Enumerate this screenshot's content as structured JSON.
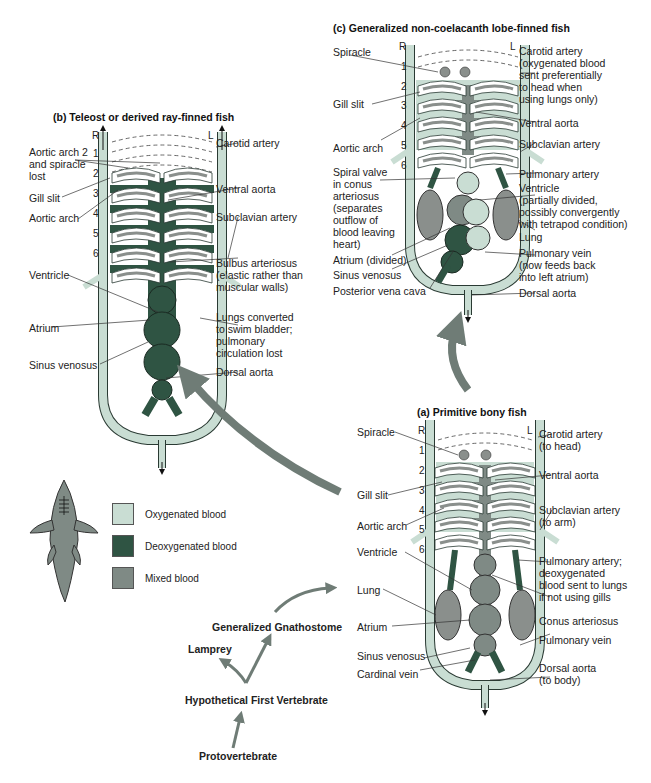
{
  "colors": {
    "oxygenated": "#c9ddd3",
    "deoxygenated": "#2f5443",
    "mixed": "#7f8a85",
    "vessel_outline": "#2a3a33",
    "gill_bar": "#8a8f8c",
    "evolution_arrow": "#6f7c76"
  },
  "legend": {
    "items": [
      {
        "label": "Oxygenated blood",
        "swatch": "oxygenated"
      },
      {
        "label": "Deoxygenated blood",
        "swatch": "deoxygenated"
      },
      {
        "label": "Mixed blood",
        "swatch": "mixed"
      }
    ],
    "fish_icon": "shark-silhouette-icon"
  },
  "evolution_tree": {
    "nodes": [
      "Protovertebrate",
      "Hypothetical First Vertebrate",
      "Lamprey",
      "Generalized Gnathostome"
    ]
  },
  "panel_a": {
    "title": "(a) Primitive bony fish",
    "side_right": "R",
    "side_left": "L",
    "arch_numbers": [
      "1",
      "2",
      "3",
      "4",
      "5",
      "6"
    ],
    "left_labels": [
      "Spiracle",
      "Gill slit",
      "Aortic arch",
      "Ventricle",
      "Lung",
      "Atrium",
      "Sinus venosus",
      "Cardinal vein"
    ],
    "right_labels": [
      "Carotid artery\n(to head)",
      "Ventral aorta",
      "Subclavian artery\n(to arm)",
      "Pulmonary artery;\ndeoxygenated\nblood sent to lungs\nif not using gills",
      "Conus arteriosus",
      "Pulmonary vein",
      "Dorsal aorta\n(to body)"
    ]
  },
  "panel_b": {
    "title": "(b) Teleost or derived ray-finned fish",
    "side_right": "R",
    "side_left": "L",
    "arch_numbers": [
      "1",
      "2",
      "3",
      "4",
      "5",
      "6"
    ],
    "left_labels": [
      "Aortic arch 2\nand spiracle\nlost",
      "Gill slit",
      "Aortic arch",
      "Ventricle",
      "Atrium",
      "Sinus venosus"
    ],
    "right_labels": [
      "Carotid artery",
      "Ventral aorta",
      "Subclavian artery",
      "Bulbus arteriosus\n(elastic rather than\nmuscular walls)",
      "Lungs converted\nto swim bladder;\npulmonary\ncirculation lost",
      "Dorsal aorta"
    ]
  },
  "panel_c": {
    "title": "(c) Generalized non-coelacanth lobe-finned fish",
    "side_right": "R",
    "side_left": "L",
    "arch_numbers": [
      "1",
      "2",
      "3",
      "4",
      "5",
      "6"
    ],
    "left_labels": [
      "Spiracle",
      "Gill slit",
      "Aortic arch",
      "Spiral valve\nin conus\narteriosus\n(separates\noutflow of\nblood leaving\nheart)",
      "Atrium (divided)",
      "Sinus venosus",
      "Posterior vena cava"
    ],
    "right_labels": [
      "Carotid artery\n(oxygenated blood\nsent preferentially\nto head when\nusing lungs only)",
      "Ventral aorta",
      "Subclavian artery",
      "Pulmonary artery",
      "Ventricle\n(partially divided,\npossibly convergently\nwith tetrapod condition)",
      "Lung",
      "Pulmonary vein\n(now feeds back\ninto left atrium)",
      "Dorsal aorta"
    ]
  }
}
